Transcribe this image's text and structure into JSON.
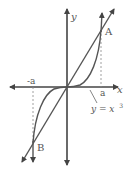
{
  "diagram": {
    "axes": {
      "x_label": "x",
      "y_label": "y"
    },
    "points": [
      {
        "name": "A",
        "label": "A"
      },
      {
        "name": "B",
        "label": "B"
      }
    ],
    "ticks": {
      "positive": "a",
      "negative": "-a"
    },
    "curve_label": {
      "text": "y = x",
      "exponent": "3"
    },
    "colors": {
      "stroke": "#555555",
      "dashed": "#888888",
      "background": "#ffffff"
    }
  }
}
